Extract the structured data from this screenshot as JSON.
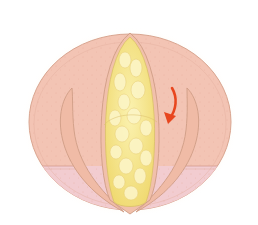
{
  "illustration": {
    "subject": "larynx-vocal-folds-with-lesion",
    "colors": {
      "background": "#ffffff",
      "glow": "#fbeed6",
      "outer_tissue": "#f3c4b4",
      "outer_stroke": "#d9a590",
      "lower_band": "#f2c9cc",
      "fold_fill": "#f0bba6",
      "fold_stroke": "#cf9d86",
      "lesion_fill": "#f5e689",
      "lesion_highlight": "#fbf4c2",
      "lesion_stroke": "#d9bf6a",
      "arrow": "#e8461e",
      "stipple": "#e7a99a"
    },
    "arrow": {
      "direction": "clockwise-down",
      "color_name": "red"
    }
  }
}
